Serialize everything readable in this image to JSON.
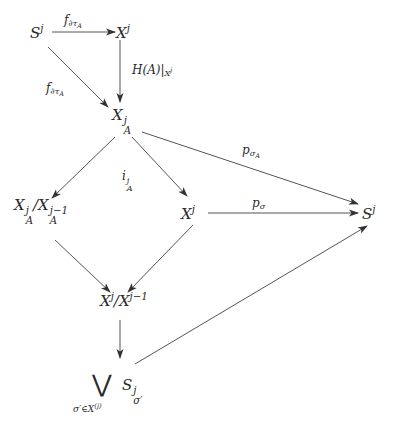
{
  "diagram": {
    "nodes": {
      "S_top": {
        "base": "S",
        "sup": "j"
      },
      "X_top": {
        "base": "X",
        "sup": "j"
      },
      "XA": {
        "base": "X",
        "sup": "j",
        "sub": "A"
      },
      "quotA_num": {
        "base": "X",
        "sup": "j",
        "sub": "A"
      },
      "quotA_sep": "/",
      "quotA_den": {
        "base": "X",
        "sup": "j−1",
        "sub": "A"
      },
      "X_mid": {
        "base": "X",
        "sup": "j"
      },
      "S_right": {
        "base": "S",
        "sup": "j"
      },
      "quot_num": {
        "base": "X",
        "sup": "j"
      },
      "quot_sep": "/",
      "quot_den": {
        "base": "X",
        "sup": "j−1"
      },
      "wedge": {
        "symbol": "⋁",
        "index": "σ′∈X",
        "index_sup": "(j)",
        "term_base": "S",
        "term_sup": "j",
        "term_sub": "σ′"
      }
    },
    "labels": {
      "f_top": {
        "base": "f",
        "sub": "∂τ",
        "subsub": "A"
      },
      "f_diag": {
        "base": "f",
        "sub": "∂τ",
        "subsub": "A"
      },
      "H_restrict": {
        "text": "H(A)|",
        "sub": "X",
        "subsup": "j"
      },
      "i_A": {
        "base": "i",
        "sup": "j",
        "sub": "A"
      },
      "p_sigmaA": {
        "base": "p",
        "sub": "σ",
        "subsub": "A"
      },
      "p_sigma": {
        "base": "p",
        "sub": "σ"
      }
    },
    "colors": {
      "line": "#555555",
      "text": "#2a2a2a",
      "background": "#ffffff"
    }
  }
}
